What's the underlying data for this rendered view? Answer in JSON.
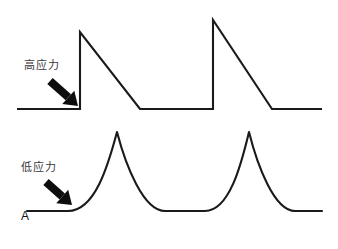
{
  "figure": {
    "panel_label": "A",
    "background_color": "#ffffff",
    "stroke_color": "#1a1a1a",
    "label_color": "#3a3a3a",
    "width": 338,
    "height": 249,
    "annotations": [
      {
        "id": "high-stress",
        "text": "高应力",
        "meaning": "high-stress",
        "x": 24,
        "y": 59,
        "arrow": {
          "from_x": 50,
          "from_y": 81,
          "to_x": 78,
          "to_y": 106,
          "name": "high-stress-arrow"
        }
      },
      {
        "id": "low-stress",
        "text": "低应力",
        "meaning": "low-stress",
        "x": 21,
        "y": 161,
        "arrow": {
          "from_x": 46,
          "from_y": 182,
          "to_x": 72,
          "to_y": 205,
          "name": "low-stress-arrow"
        }
      }
    ]
  },
  "chart_data": {
    "type": "line",
    "title": "",
    "xlabel": "",
    "ylabel": "",
    "grid": false,
    "legend": "none",
    "axis_shown": false,
    "series": [
      {
        "name": "高应力",
        "name_en": "high stress",
        "waveform": "sawtooth",
        "stroke": "#1a1a1a",
        "stroke_width": 2.1,
        "baseline_y": 109,
        "peaks": [
          {
            "x": 80,
            "y": 32
          },
          {
            "x": 213,
            "y": 20
          }
        ],
        "points": [
          [
            17,
            109
          ],
          [
            80,
            109
          ],
          [
            80,
            32
          ],
          [
            140,
            109
          ],
          [
            213,
            109
          ],
          [
            213,
            20
          ],
          [
            272,
            109
          ],
          [
            322,
            109
          ]
        ]
      },
      {
        "name": "低应力",
        "name_en": "low stress",
        "waveform": "smooth-bell",
        "stroke": "#1a1a1a",
        "stroke_width": 2.1,
        "baseline_y": 211,
        "peaks": [
          {
            "x": 117,
            "y": 132
          },
          {
            "x": 249,
            "y": 132
          }
        ],
        "points": [
          [
            27,
            211
          ],
          [
            68,
            211
          ],
          [
            117,
            132
          ],
          [
            165,
            211
          ],
          [
            205,
            211
          ],
          [
            249,
            132
          ],
          [
            295,
            211
          ],
          [
            322,
            211
          ]
        ]
      }
    ]
  }
}
